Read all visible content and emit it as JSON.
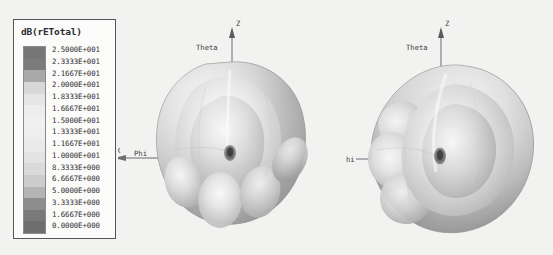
{
  "background_color": "#f2f2f0",
  "legend": {
    "title": "dB(rETotal)",
    "border_color": "#55565a",
    "entries": [
      {
        "value": "2.5000E+001",
        "color": "#767676"
      },
      {
        "value": "2.3333E+001",
        "color": "#7c7c7c"
      },
      {
        "value": "2.1667E+001",
        "color": "#a9a9a9"
      },
      {
        "value": "2.0000E+001",
        "color": "#d8d8d8"
      },
      {
        "value": "1.8333E+001",
        "color": "#e6e6e6"
      },
      {
        "value": "1.6667E+001",
        "color": "#ededed"
      },
      {
        "value": "1.5000E+001",
        "color": "#f0f0f0"
      },
      {
        "value": "1.3333E+001",
        "color": "#eeeeee"
      },
      {
        "value": "1.1667E+001",
        "color": "#eaeaea"
      },
      {
        "value": "1.0000E+001",
        "color": "#e3e3e3"
      },
      {
        "value": "8.3333E+000",
        "color": "#dadada"
      },
      {
        "value": "6.6667E+000",
        "color": "#cdcdcd"
      },
      {
        "value": "5.0000E+000",
        "color": "#b4b4b4"
      },
      {
        "value": "3.3333E+000",
        "color": "#8d8d8d"
      },
      {
        "value": "1.6667E+000",
        "color": "#797979"
      },
      {
        "value": "0.0000E+000",
        "color": "#6e6e6e"
      }
    ]
  },
  "plots": [
    {
      "id": "plot-left",
      "name": "radiation-pattern-left",
      "axes": [
        {
          "label": "Z",
          "name": "axis-label-z"
        },
        {
          "label": "Theta",
          "name": "axis-label-theta"
        },
        {
          "label": "Phi",
          "name": "axis-label-phi"
        },
        {
          "label": "X",
          "name": "axis-label-x"
        }
      ]
    },
    {
      "id": "plot-right",
      "name": "radiation-pattern-right",
      "axes": [
        {
          "label": "Z",
          "name": "axis-label-z"
        },
        {
          "label": "Theta",
          "name": "axis-label-theta"
        },
        {
          "label": "hi",
          "name": "axis-label-phi"
        }
      ]
    }
  ],
  "chart_data": {
    "type": "heatmap",
    "title": "dB(rETotal)",
    "colormap": "grayscale-banded",
    "legend_label": "dB(rETotal)",
    "units": "dB",
    "scale_min": 0.0,
    "scale_max": 25.0,
    "n_bands": 16,
    "tick_values": [
      25.0,
      23.333,
      21.667,
      20.0,
      18.333,
      16.667,
      15.0,
      13.333,
      11.667,
      10.0,
      8.3333,
      6.6667,
      5.0,
      3.3333,
      1.6667,
      0.0
    ],
    "tick_labels": [
      "2.5000E+001",
      "2.3333E+001",
      "2.1667E+001",
      "2.0000E+001",
      "1.8333E+001",
      "1.6667E+001",
      "1.5000E+001",
      "1.3333E+001",
      "1.1667E+001",
      "1.0000E+001",
      "8.3333E+000",
      "6.6667E+000",
      "5.0000E+000",
      "3.3333E+000",
      "1.6667E+000",
      "0.0000E+000"
    ],
    "axis_labels": [
      "Z",
      "Theta",
      "Phi",
      "X"
    ],
    "grid": false,
    "legend_position": "left"
  }
}
